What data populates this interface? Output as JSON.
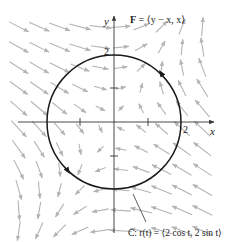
{
  "figure": {
    "field_label": "F = ⟨y − x, x⟩",
    "field_label_bold": "F",
    "field_label_rest": " = ⟨y − x, x⟩",
    "curve_label": "C: r(t) = ⟨2 cos t, 2 sin t⟩",
    "x_axis_label": "x",
    "y_axis_label": "y",
    "x_tick_label": "2",
    "y_tick_label": "2",
    "circle_radius": 2,
    "orientation": "counterclockwise",
    "colors": {
      "arrow": "#b4b4b4",
      "curve": "#1a1a1a",
      "axis": "#333333"
    }
  },
  "field": {
    "formula": "F(x,y) = (y - x, x)",
    "grid_step": 0.6,
    "x_range": [
      -2.8,
      2.8
    ],
    "y_range": [
      -3.2,
      3.0
    ]
  }
}
